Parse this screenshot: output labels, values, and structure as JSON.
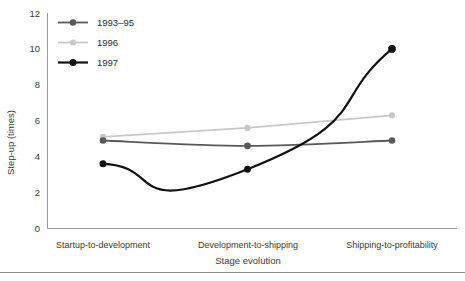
{
  "chart_data": {
    "type": "line",
    "title": "",
    "xlabel": "Stage evolution",
    "ylabel": "Step-up (times)",
    "categories": [
      "Startup-to-development",
      "Development-to-shipping",
      "Shipping-to-profitability"
    ],
    "series": [
      {
        "name": "1993–95",
        "values": [
          4.9,
          4.6,
          4.9
        ],
        "color": "#595959"
      },
      {
        "name": "1996",
        "values": [
          5.1,
          5.6,
          6.3
        ],
        "color": "#c8c8c8"
      },
      {
        "name": "1997",
        "values": [
          3.6,
          3.3,
          10.0
        ],
        "color": "#111111"
      }
    ],
    "ylim": [
      0,
      12
    ],
    "yticks": [
      0,
      2,
      4,
      6,
      8,
      10,
      12
    ],
    "ytick_labels": [
      "0",
      "2",
      "4",
      "6",
      "8",
      "10",
      "12"
    ],
    "grid": false,
    "legend_position": "top-left-inside",
    "smoothing": "spline"
  },
  "axes": {
    "y_title": "Step-up (times)",
    "x_title": "Stage evolution",
    "y_ticks": [
      "12",
      "10",
      "8",
      "6",
      "4",
      "2",
      "0"
    ],
    "x_categories": [
      "Startup-to-development",
      "Development-to-shipping",
      "Shipping-to-profitability"
    ]
  },
  "legend": {
    "items": [
      {
        "label": "1993–95",
        "color": "#595959"
      },
      {
        "label": "1996",
        "color": "#c8c8c8"
      },
      {
        "label": "1997",
        "color": "#111111"
      }
    ]
  },
  "colors": {
    "series_1993_95": "#595959",
    "series_1996": "#c8c8c8",
    "series_1997": "#111111",
    "axis": "#9a9a9a",
    "text": "#2b2b2b",
    "background": "#ffffff"
  }
}
